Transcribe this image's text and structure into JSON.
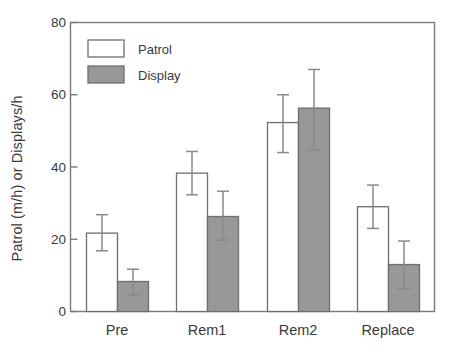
{
  "chart_data": {
    "type": "bar",
    "title": "",
    "xlabel": "",
    "ylabel": "Patrol (m/h)  or Displays/h",
    "categories": [
      "Pre",
      "Rem1",
      "Rem2",
      "Replace"
    ],
    "ylim": [
      0,
      80
    ],
    "yticks": [
      0,
      20,
      40,
      60,
      80
    ],
    "ytick_labels": [
      "0",
      "20",
      "40",
      "60",
      "80"
    ],
    "grid": false,
    "legend_position": "top-left",
    "error_bars": true,
    "series": [
      {
        "name": "Patrol",
        "color": "#ffffff",
        "edge_color": "#6e6e6e",
        "values": [
          21.7,
          38.3,
          52.3,
          29.0
        ],
        "err_upper": [
          26.8,
          44.3,
          60.0,
          35.0
        ],
        "err_lower": [
          16.8,
          32.3,
          44.0,
          23.0
        ]
      },
      {
        "name": "Display",
        "color": "#989898",
        "edge_color": "#6e6e6e",
        "values": [
          8.3,
          26.3,
          56.3,
          13.0
        ],
        "err_upper": [
          11.7,
          33.3,
          67.0,
          19.5
        ],
        "err_lower": [
          4.5,
          19.8,
          44.8,
          6.3
        ]
      }
    ]
  },
  "legend": {
    "items": [
      {
        "label": "Patrol",
        "swatch": "#ffffff"
      },
      {
        "label": "Display",
        "swatch": "#989898"
      }
    ]
  },
  "axes": {
    "y_axis_label": "Patrol (m/h)  or Displays/h",
    "y_tick_labels": [
      "80",
      "60",
      "40",
      "20",
      "0"
    ],
    "x_tick_labels": [
      "Pre",
      "Rem1",
      "Rem2",
      "Replace"
    ]
  },
  "colors": {
    "frame": "#7a7a7a",
    "bar_edge": "#6e6e6e",
    "bar_fill_display": "#989898",
    "bar_fill_patrol": "#ffffff",
    "error_bar": "#8a8a8a",
    "text": "#3a3a3a"
  }
}
